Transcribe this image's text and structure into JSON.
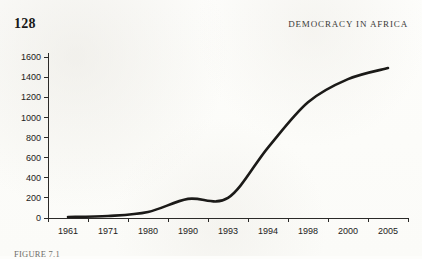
{
  "page": {
    "folio": "128",
    "running_title": "DEMOCRACY IN AFRICA",
    "background_color": "#fdfdfb",
    "ink_color": "#1b1a18"
  },
  "caption": {
    "text": "FIGURE 7.1"
  },
  "chart_data": {
    "type": "line",
    "title": "",
    "subtitle": "",
    "xlabel": "",
    "ylabel": "",
    "categories": [
      "1961",
      "1971",
      "1980",
      "1990",
      "1993",
      "1994",
      "1998",
      "2000",
      "2005"
    ],
    "values": [
      10,
      20,
      60,
      190,
      200,
      700,
      1150,
      1380,
      1490
    ],
    "series": [
      {
        "name": "",
        "values": [
          10,
          20,
          60,
          190,
          200,
          700,
          1150,
          1380,
          1490
        ]
      }
    ],
    "ylim": [
      0,
      1600
    ],
    "ytick_labels": [
      "0",
      "200",
      "400",
      "600",
      "800",
      "1000",
      "1200",
      "1400",
      "1600"
    ],
    "ytick_values": [
      0,
      200,
      400,
      600,
      800,
      1000,
      1200,
      1400,
      1600
    ],
    "xtick_labels": [
      "1961",
      "1971",
      "1980",
      "1990",
      "1993",
      "1994",
      "1998",
      "2000",
      "2005"
    ],
    "grid": false,
    "legend": false,
    "legend_position": "none",
    "line_color": "#1b1a18",
    "annotations": []
  }
}
